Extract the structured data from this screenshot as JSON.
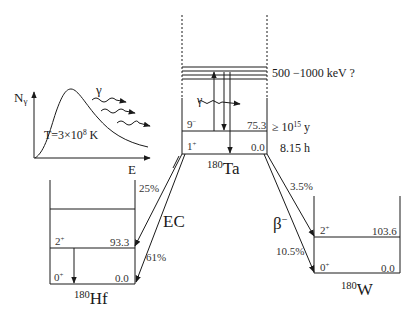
{
  "inset": {
    "y_axis_label": "N",
    "y_axis_sub": "γ",
    "x_axis_label": "E",
    "gamma_label": "γ",
    "temperature_label": "T=3×10",
    "temperature_exp": "8",
    "temperature_unit": " K"
  },
  "ta180": {
    "mass": "180",
    "symbol": "Ta",
    "band_label": "500 −1000 keV ?",
    "gamma_label": "γ",
    "levels": [
      {
        "spin": "9",
        "parity": "−",
        "energy": "75.3",
        "halflife_prefix": "≥ 10",
        "halflife_exp": "15",
        "halflife_unit": " y"
      },
      {
        "spin": "1",
        "parity": "+",
        "energy": "0.0",
        "halflife": "8.15 h"
      }
    ]
  },
  "hf180": {
    "mass": "180",
    "symbol": "Hf",
    "decay_mode": "EC",
    "branches": [
      "25%",
      "61%"
    ],
    "levels": [
      {
        "spin": "2",
        "parity": "+",
        "energy": "93.3"
      },
      {
        "spin": "0",
        "parity": "+",
        "energy": "0.0"
      }
    ]
  },
  "w180": {
    "mass": "180",
    "symbol": "W",
    "decay_mode": "β",
    "decay_mode_sup": "−",
    "branches": [
      "3.5%",
      "10.5%"
    ],
    "levels": [
      {
        "spin": "2",
        "parity": "+",
        "energy": "103.6"
      },
      {
        "spin": "0",
        "parity": "+",
        "energy": "0.0"
      }
    ]
  },
  "colors": {
    "line": "#1a1a1a",
    "text": "#1a1a1a",
    "small_text": "#333333"
  }
}
